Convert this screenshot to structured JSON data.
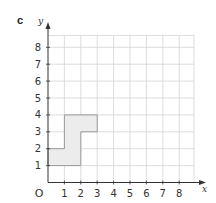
{
  "part_label": "c",
  "axes": {
    "x_label": "x",
    "y_label": "y",
    "origin_label": "O",
    "x_ticks": [
      "1",
      "2",
      "3",
      "4",
      "5",
      "6",
      "7",
      "8"
    ],
    "y_ticks": [
      "1",
      "2",
      "3",
      "4",
      "5",
      "6",
      "7",
      "8"
    ],
    "xlim": [
      0,
      9
    ],
    "ylim": [
      0,
      9
    ]
  },
  "shape": {
    "fill": "#ececec",
    "stroke": "#9a9a9a",
    "vertices": [
      [
        0,
        1
      ],
      [
        2,
        1
      ],
      [
        2,
        3
      ],
      [
        3,
        3
      ],
      [
        3,
        4
      ],
      [
        1,
        4
      ],
      [
        1,
        2
      ],
      [
        0,
        2
      ]
    ]
  },
  "chart_data": {
    "type": "scatter",
    "title": "",
    "xlabel": "x",
    "ylabel": "y",
    "xlim": [
      0,
      9
    ],
    "ylim": [
      0,
      9
    ],
    "grid": true,
    "x_ticks": [
      1,
      2,
      3,
      4,
      5,
      6,
      7,
      8
    ],
    "y_ticks": [
      1,
      2,
      3,
      4,
      5,
      6,
      7,
      8
    ],
    "series": [
      {
        "name": "shaded shape",
        "polygon": [
          [
            0,
            1
          ],
          [
            2,
            1
          ],
          [
            2,
            3
          ],
          [
            3,
            3
          ],
          [
            3,
            4
          ],
          [
            1,
            4
          ],
          [
            1,
            2
          ],
          [
            0,
            2
          ]
        ]
      }
    ],
    "annotations": [
      "c",
      "O"
    ]
  }
}
